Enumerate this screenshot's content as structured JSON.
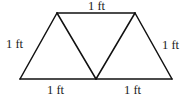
{
  "diagram": {
    "type": "geometry",
    "labels": {
      "top": "1 ft",
      "left": "1 ft",
      "right": "1 ft",
      "bottom_left": "1 ft",
      "bottom_right": "1 ft"
    },
    "colors": {
      "stroke": "#111111",
      "text": "#1a1a1a",
      "background": "#ffffff"
    }
  }
}
